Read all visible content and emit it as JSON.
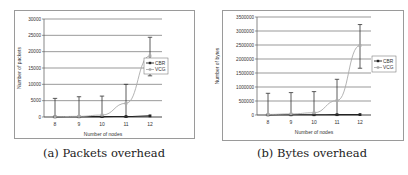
{
  "captions": {
    "a": "(a) Packets overhead",
    "b": "(b) Bytes overhead"
  },
  "colors": {
    "cbr": "#222222",
    "vcg": "#aaaaaa",
    "grid": "#555555",
    "errorbar": "#333333",
    "frame": "#9a9a9a"
  },
  "chart_data": [
    {
      "type": "line",
      "title": "",
      "caption": "(a) Packets overhead",
      "xlabel": "Number of nodes",
      "ylabel": "Number of packets",
      "categories": [
        8,
        9,
        10,
        11,
        12
      ],
      "yticks": [
        0,
        5000,
        10000,
        15000,
        20000,
        25000,
        30000
      ],
      "ylim": [
        0,
        30000
      ],
      "grid": true,
      "legend_position": "right",
      "series": [
        {
          "name": "CBR",
          "values": [
            50,
            80,
            120,
            150,
            350
          ],
          "error_low": [
            0,
            0,
            0,
            0,
            0
          ],
          "error_high": [
            0,
            0,
            0,
            0,
            0
          ]
        },
        {
          "name": "VCG",
          "values": [
            100,
            200,
            600,
            4200,
            18700
          ],
          "error_low": [
            0,
            0,
            0,
            0,
            12600
          ],
          "error_high": [
            5700,
            6200,
            6400,
            10000,
            24400
          ]
        }
      ]
    },
    {
      "type": "line",
      "title": "",
      "caption": "(b) Bytes overhead",
      "xlabel": "Number of nodes",
      "ylabel": "Number of bytes",
      "categories": [
        8,
        9,
        10,
        11,
        12
      ],
      "yticks": [
        0,
        500000,
        1000000,
        1500000,
        2000000,
        2500000,
        3000000,
        3500000
      ],
      "ylim": [
        0,
        3500000
      ],
      "grid": true,
      "legend_position": "right",
      "series": [
        {
          "name": "CBR",
          "values": [
            5000,
            8000,
            10000,
            12000,
            15000
          ],
          "error_low": [
            0,
            0,
            0,
            0,
            0
          ],
          "error_high": [
            0,
            0,
            0,
            0,
            0
          ]
        },
        {
          "name": "VCG",
          "values": [
            20000,
            40000,
            80000,
            515000,
            2480000
          ],
          "error_low": [
            0,
            0,
            0,
            0,
            1670000
          ],
          "error_high": [
            775000,
            800000,
            835000,
            1275000,
            3230000
          ]
        }
      ]
    }
  ]
}
